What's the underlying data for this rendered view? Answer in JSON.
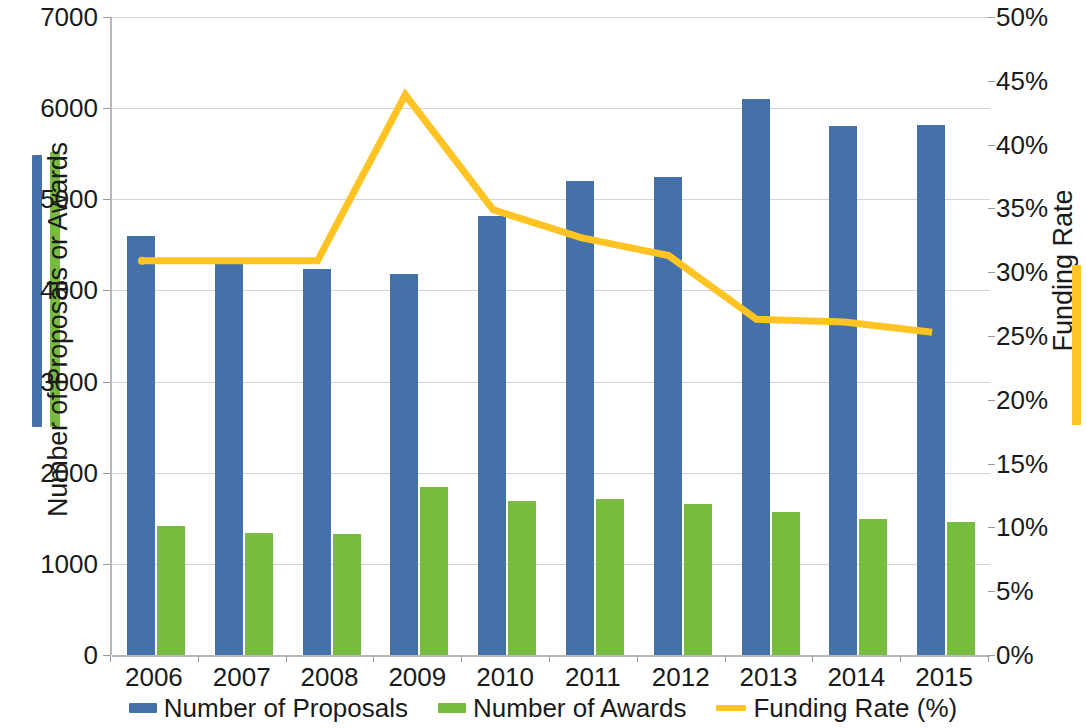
{
  "chart_data": {
    "type": "bar",
    "title": "",
    "subtitle": "",
    "xlabel": "",
    "ylabel": "Number of Proposals or Awards",
    "y2label": "Funding Rate",
    "categories": [
      "2006",
      "2007",
      "2008",
      "2009",
      "2010",
      "2011",
      "2012",
      "2013",
      "2014",
      "2015"
    ],
    "ylim": [
      0,
      7000
    ],
    "y2lim": [
      0,
      50
    ],
    "yticks": [
      "0",
      "1000",
      "2000",
      "3000",
      "4000",
      "5000",
      "6000",
      "7000"
    ],
    "y2ticks": [
      "0%",
      "5%",
      "10%",
      "15%",
      "20%",
      "25%",
      "30%",
      "35%",
      "40%",
      "45%",
      "50%"
    ],
    "grid": true,
    "legend_position": "bottom",
    "series": [
      {
        "name": "Number of Proposals",
        "type": "bar",
        "axis": "left",
        "color": "#4472a8",
        "values": [
          4600,
          4310,
          4240,
          4180,
          4820,
          5200,
          5250,
          6100,
          5800,
          5820
        ]
      },
      {
        "name": "Number of Awards",
        "type": "bar",
        "axis": "left",
        "color": "#77bc3f",
        "values": [
          1420,
          1340,
          1330,
          1840,
          1690,
          1710,
          1660,
          1570,
          1490,
          1460
        ]
      },
      {
        "name": "Funding Rate (%)",
        "type": "line",
        "axis": "right",
        "color": "#ffc423",
        "values": [
          30.9,
          30.9,
          30.9,
          43.9,
          34.9,
          32.7,
          31.3,
          26.3,
          26.1,
          25.3
        ]
      }
    ]
  },
  "legend": {
    "items": [
      {
        "label": "Number of Proposals",
        "color": "#4472a8",
        "marker": "bar"
      },
      {
        "label": "Number of Awards",
        "color": "#77bc3f",
        "marker": "bar"
      },
      {
        "label": "Funding Rate (%)",
        "color": "#ffc423",
        "marker": "line"
      }
    ]
  },
  "axis_titles": {
    "left": "Number of Proposals or Awards",
    "right": "Funding Rate"
  },
  "colors": {
    "proposals": "#4472a8",
    "awards": "#77bc3f",
    "funding_rate": "#ffc423",
    "grid": "#d4d4d4",
    "axis": "#b8b8b8",
    "text": "#1a1a1a",
    "background": "#ffffff"
  }
}
